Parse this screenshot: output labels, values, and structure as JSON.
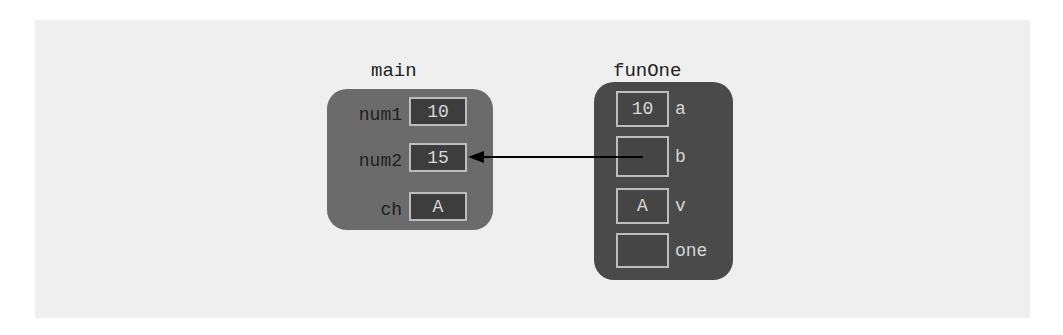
{
  "diagram": {
    "type": "memory-stack-frames",
    "colors": {
      "background": "#ffffff",
      "panel": "#efefef",
      "main_frame": "#6b6b6b",
      "funOne_frame": "#4a4a4a",
      "cell_border": "#bdbdbd",
      "arrow": "#000000"
    },
    "frames": [
      {
        "name": "main",
        "variables": [
          {
            "name": "num1",
            "value": "10"
          },
          {
            "name": "num2",
            "value": "15"
          },
          {
            "name": "ch",
            "value": "A"
          }
        ]
      },
      {
        "name": "funOne",
        "variables": [
          {
            "name": "a",
            "value": "10"
          },
          {
            "name": "b",
            "value": ""
          },
          {
            "name": "v",
            "value": "A"
          },
          {
            "name": "one",
            "value": ""
          }
        ]
      }
    ],
    "references": [
      {
        "from": "funOne.b",
        "to": "main.num2",
        "style": "arrow"
      }
    ]
  }
}
